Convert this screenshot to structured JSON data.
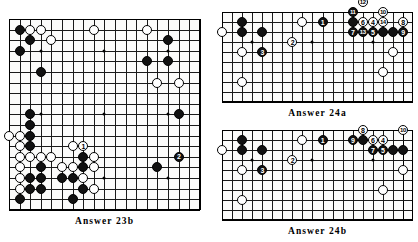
{
  "page": {
    "kind": "go-problem-answer-diagrams",
    "background": "#ffffff",
    "ink": "#111111"
  },
  "boards": [
    {
      "id": "answer-23b",
      "caption": "Answer  23b",
      "board_size": 19,
      "cols": 19,
      "rows": 19,
      "geometry": {
        "x": 9,
        "y": 19,
        "w": 191,
        "h": 191,
        "cell": 10.6
      },
      "hoshi": [
        [
          3,
          3
        ],
        [
          9,
          3
        ],
        [
          15,
          3
        ],
        [
          3,
          9
        ],
        [
          9,
          9
        ],
        [
          15,
          9
        ],
        [
          3,
          15
        ],
        [
          9,
          15
        ],
        [
          15,
          15
        ]
      ],
      "stones": [
        {
          "c": "b",
          "x": 1,
          "y": 1
        },
        {
          "c": "w",
          "x": 2,
          "y": 1
        },
        {
          "c": "w",
          "x": 3,
          "y": 1
        },
        {
          "c": "b",
          "x": 2,
          "y": 2
        },
        {
          "c": "w",
          "x": 4,
          "y": 2
        },
        {
          "c": "b",
          "x": 1,
          "y": 3
        },
        {
          "c": "b",
          "x": 3,
          "y": 5
        },
        {
          "c": "w",
          "x": 8,
          "y": 1
        },
        {
          "c": "w",
          "x": 13,
          "y": 1
        },
        {
          "c": "b",
          "x": 15,
          "y": 2
        },
        {
          "c": "b",
          "x": 13,
          "y": 4
        },
        {
          "c": "b",
          "x": 15,
          "y": 4
        },
        {
          "c": "w",
          "x": 14,
          "y": 6
        },
        {
          "c": "w",
          "x": 16,
          "y": 6
        },
        {
          "c": "b",
          "x": 16,
          "y": 9
        },
        {
          "c": "b",
          "x": 2,
          "y": 9
        },
        {
          "c": "b",
          "x": 2,
          "y": 10
        },
        {
          "c": "w",
          "x": 0,
          "y": 11
        },
        {
          "c": "w",
          "x": 1,
          "y": 11
        },
        {
          "c": "b",
          "x": 2,
          "y": 11
        },
        {
          "c": "w",
          "x": 1,
          "y": 12
        },
        {
          "c": "b",
          "x": 2,
          "y": 12
        },
        {
          "c": "w",
          "x": 1,
          "y": 13
        },
        {
          "c": "w",
          "x": 2,
          "y": 13
        },
        {
          "c": "w",
          "x": 3,
          "y": 13
        },
        {
          "c": "w",
          "x": 4,
          "y": 13
        },
        {
          "c": "w",
          "x": 6,
          "y": 12
        },
        {
          "c": "w",
          "x": 7,
          "y": 12,
          "n": "1",
          "nc": "w"
        },
        {
          "c": "b",
          "x": 7,
          "y": 13
        },
        {
          "c": "w",
          "x": 8,
          "y": 13
        },
        {
          "c": "b",
          "x": 3,
          "y": 14
        },
        {
          "c": "w",
          "x": 1,
          "y": 14
        },
        {
          "c": "w",
          "x": 5,
          "y": 14
        },
        {
          "c": "w",
          "x": 6,
          "y": 14
        },
        {
          "c": "b",
          "x": 7,
          "y": 14
        },
        {
          "c": "w",
          "x": 8,
          "y": 14
        },
        {
          "c": "w",
          "x": 1,
          "y": 15
        },
        {
          "c": "b",
          "x": 2,
          "y": 15
        },
        {
          "c": "b",
          "x": 3,
          "y": 15
        },
        {
          "c": "b",
          "x": 5,
          "y": 15
        },
        {
          "c": "b",
          "x": 6,
          "y": 15
        },
        {
          "c": "w",
          "x": 7,
          "y": 15
        },
        {
          "c": "w",
          "x": 1,
          "y": 16
        },
        {
          "c": "b",
          "x": 2,
          "y": 16
        },
        {
          "c": "b",
          "x": 3,
          "y": 16
        },
        {
          "c": "b",
          "x": 7,
          "y": 16
        },
        {
          "c": "w",
          "x": 8,
          "y": 16
        },
        {
          "c": "b",
          "x": 1,
          "y": 17
        },
        {
          "c": "b",
          "x": 6,
          "y": 17
        },
        {
          "c": "b",
          "x": 14,
          "y": 14
        },
        {
          "c": "b",
          "x": 16,
          "y": 13,
          "n": "2",
          "nc": "b"
        }
      ]
    },
    {
      "id": "answer-24a",
      "caption": "Answer  24a",
      "board_size": 19,
      "cols": 19,
      "rows": 10,
      "geometry": {
        "x": 222,
        "y": 12,
        "w": 191,
        "h": 90,
        "cell": 10.05
      },
      "hoshi": [
        [
          3,
          3
        ],
        [
          9,
          3
        ],
        [
          15,
          3
        ]
      ],
      "stones": [
        {
          "c": "b",
          "x": 2,
          "y": 1
        },
        {
          "c": "w",
          "x": 0,
          "y": 2
        },
        {
          "c": "b",
          "x": 2,
          "y": 2
        },
        {
          "c": "b",
          "x": 4,
          "y": 2
        },
        {
          "c": "w",
          "x": 2,
          "y": 4
        },
        {
          "c": "b",
          "x": 4,
          "y": 4,
          "n": "3",
          "nc": "b"
        },
        {
          "c": "w",
          "x": 2,
          "y": 7
        },
        {
          "c": "w",
          "x": 8,
          "y": 1
        },
        {
          "c": "b",
          "x": 10,
          "y": 1,
          "n": "1",
          "nc": "b"
        },
        {
          "c": "w",
          "x": 7,
          "y": 3,
          "n": "2",
          "nc": "w"
        },
        {
          "c": "b",
          "x": 13,
          "y": 0,
          "n": "11",
          "nc": "b"
        },
        {
          "c": "w",
          "x": 14,
          "y": -1,
          "n": "12",
          "nc": "w"
        },
        {
          "c": "w",
          "x": 16,
          "y": 0,
          "n": "10",
          "nc": "w"
        },
        {
          "c": "b",
          "x": 13,
          "y": 1
        },
        {
          "c": "w",
          "x": 14,
          "y": 1,
          "n": "6",
          "nc": "w"
        },
        {
          "c": "w",
          "x": 15,
          "y": 1,
          "n": "4",
          "nc": "w"
        },
        {
          "c": "w",
          "x": 16,
          "y": 1,
          "n": "14",
          "nc": "w"
        },
        {
          "c": "w",
          "x": 18,
          "y": 1,
          "n": "8",
          "nc": "w"
        },
        {
          "c": "b",
          "x": 13,
          "y": 2,
          "n": "7",
          "nc": "b"
        },
        {
          "c": "b",
          "x": 14,
          "y": 2,
          "n": "13",
          "nc": "b"
        },
        {
          "c": "b",
          "x": 15,
          "y": 2,
          "n": "5",
          "nc": "b"
        },
        {
          "c": "b",
          "x": 16,
          "y": 2
        },
        {
          "c": "b",
          "x": 17,
          "y": 2
        },
        {
          "c": "b",
          "x": 18,
          "y": 2,
          "n": "9",
          "nc": "b"
        },
        {
          "c": "w",
          "x": 17,
          "y": 4
        },
        {
          "c": "w",
          "x": 16,
          "y": 6
        }
      ]
    },
    {
      "id": "answer-24b",
      "caption": "Answer  24b",
      "board_size": 19,
      "cols": 19,
      "rows": 10,
      "geometry": {
        "x": 222,
        "y": 130,
        "w": 191,
        "h": 90,
        "cell": 10.05
      },
      "hoshi": [
        [
          3,
          3
        ],
        [
          9,
          3
        ],
        [
          15,
          3
        ]
      ],
      "stones": [
        {
          "c": "b",
          "x": 2,
          "y": 1
        },
        {
          "c": "w",
          "x": 0,
          "y": 2
        },
        {
          "c": "b",
          "x": 2,
          "y": 2
        },
        {
          "c": "b",
          "x": 4,
          "y": 2
        },
        {
          "c": "w",
          "x": 2,
          "y": 4
        },
        {
          "c": "b",
          "x": 4,
          "y": 4,
          "n": "3",
          "nc": "b"
        },
        {
          "c": "w",
          "x": 2,
          "y": 7
        },
        {
          "c": "w",
          "x": 8,
          "y": 1
        },
        {
          "c": "b",
          "x": 10,
          "y": 1,
          "n": "1",
          "nc": "b"
        },
        {
          "c": "w",
          "x": 7,
          "y": 3,
          "n": "2",
          "nc": "w"
        },
        {
          "c": "b",
          "x": 13,
          "y": 1,
          "n": "9",
          "nc": "b"
        },
        {
          "c": "b",
          "x": 14,
          "y": 1
        },
        {
          "c": "w",
          "x": 14,
          "y": 0,
          "n": "8",
          "nc": "w"
        },
        {
          "c": "w",
          "x": 15,
          "y": 1,
          "n": "6",
          "nc": "w"
        },
        {
          "c": "w",
          "x": 16,
          "y": 1,
          "n": "4",
          "nc": "w"
        },
        {
          "c": "w",
          "x": 18,
          "y": 0,
          "n": "10",
          "nc": "w"
        },
        {
          "c": "b",
          "x": 15,
          "y": 2,
          "n": "7",
          "nc": "b"
        },
        {
          "c": "b",
          "x": 16,
          "y": 2,
          "n": "5",
          "nc": "b"
        },
        {
          "c": "b",
          "x": 17,
          "y": 2
        },
        {
          "c": "b",
          "x": 18,
          "y": 2
        },
        {
          "c": "w",
          "x": 18,
          "y": 4
        },
        {
          "c": "w",
          "x": 16,
          "y": 6
        }
      ]
    }
  ]
}
